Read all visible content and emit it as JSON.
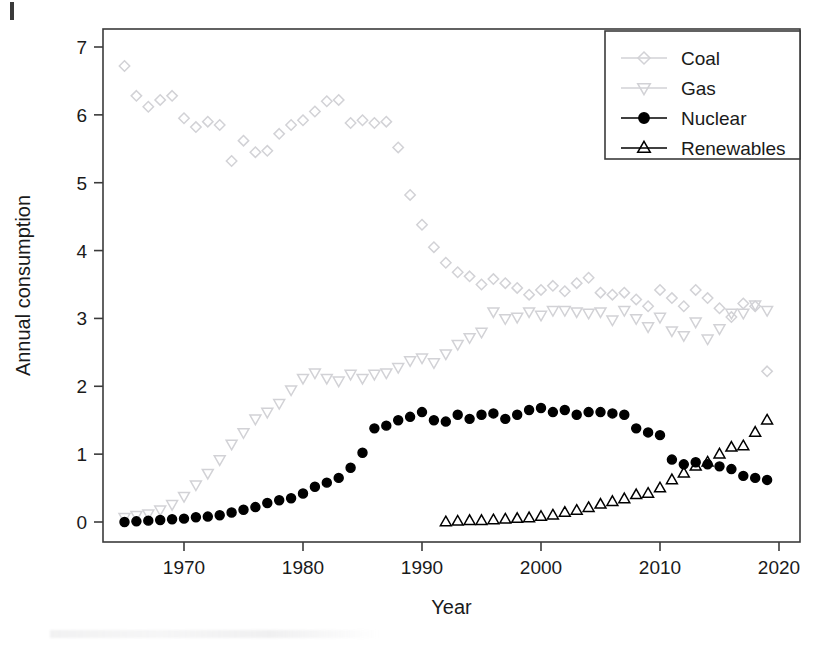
{
  "chart_data": {
    "type": "scatter",
    "title": "",
    "xlabel": "Year",
    "ylabel": "Annual consumption",
    "xlim": [
      1964.0,
      2020.6
    ],
    "ylim": [
      -0.28,
      7.35
    ],
    "xticks": [
      1970,
      1980,
      1990,
      2000,
      2010,
      2020
    ],
    "yticks": [
      0,
      1,
      2,
      3,
      4,
      5,
      6,
      7
    ],
    "grid": false,
    "legend_position": "top-right",
    "box": true,
    "series": [
      {
        "name": "Coal",
        "marker": "diamond",
        "filled": false,
        "color": "#d2d2d6",
        "x": [
          1965,
          1966,
          1967,
          1968,
          1969,
          1970,
          1971,
          1972,
          1973,
          1974,
          1975,
          1976,
          1977,
          1978,
          1979,
          1980,
          1981,
          1982,
          1983,
          1984,
          1985,
          1986,
          1987,
          1988,
          1989,
          1990,
          1991,
          1992,
          1993,
          1994,
          1995,
          1996,
          1997,
          1998,
          1999,
          2000,
          2001,
          2002,
          2003,
          2004,
          2005,
          2006,
          2007,
          2008,
          2009,
          2010,
          2011,
          2012,
          2013,
          2014,
          2015,
          2016,
          2017,
          2018,
          2019
        ],
        "y": [
          6.72,
          6.28,
          6.12,
          6.22,
          6.28,
          5.95,
          5.82,
          5.9,
          5.85,
          5.32,
          5.62,
          5.45,
          5.47,
          5.72,
          5.85,
          5.92,
          6.05,
          6.2,
          6.22,
          5.88,
          5.92,
          5.88,
          5.9,
          5.52,
          4.82,
          4.38,
          4.05,
          3.82,
          3.68,
          3.62,
          3.5,
          3.58,
          3.52,
          3.45,
          3.35,
          3.42,
          3.48,
          3.4,
          3.52,
          3.6,
          3.38,
          3.35,
          3.38,
          3.28,
          3.18,
          3.42,
          3.3,
          3.18,
          3.42,
          3.3,
          3.15,
          3.02,
          3.22,
          3.18,
          2.22
        ]
      },
      {
        "name": "Gas",
        "marker": "triangle-down",
        "filled": false,
        "color": "#d2d2d6",
        "x": [
          1965,
          1966,
          1967,
          1968,
          1969,
          1970,
          1971,
          1972,
          1973,
          1974,
          1975,
          1976,
          1977,
          1978,
          1979,
          1980,
          1981,
          1982,
          1983,
          1984,
          1985,
          1986,
          1987,
          1988,
          1989,
          1990,
          1991,
          1992,
          1993,
          1994,
          1995,
          1996,
          1997,
          1998,
          1999,
          2000,
          2001,
          2002,
          2003,
          2004,
          2005,
          2006,
          2007,
          2008,
          2009,
          2010,
          2011,
          2012,
          2013,
          2014,
          2015,
          2016,
          2017,
          2018,
          2019
        ],
        "y": [
          0.07,
          0.1,
          0.12,
          0.18,
          0.26,
          0.38,
          0.55,
          0.72,
          0.92,
          1.15,
          1.32,
          1.52,
          1.62,
          1.75,
          1.95,
          2.12,
          2.2,
          2.12,
          2.08,
          2.18,
          2.12,
          2.18,
          2.2,
          2.28,
          2.38,
          2.42,
          2.35,
          2.48,
          2.62,
          2.72,
          2.8,
          3.1,
          3.0,
          3.02,
          3.1,
          3.05,
          3.12,
          3.12,
          3.1,
          3.08,
          3.1,
          2.98,
          3.12,
          3.0,
          2.88,
          3.02,
          2.82,
          2.75,
          2.95,
          2.7,
          2.85,
          3.08,
          3.08,
          3.2,
          3.12
        ]
      },
      {
        "name": "Nuclear",
        "marker": "circle",
        "filled": true,
        "color": "#000000",
        "x": [
          1965,
          1966,
          1967,
          1968,
          1969,
          1970,
          1971,
          1972,
          1973,
          1974,
          1975,
          1976,
          1977,
          1978,
          1979,
          1980,
          1981,
          1982,
          1983,
          1984,
          1985,
          1986,
          1987,
          1988,
          1989,
          1990,
          1991,
          1992,
          1993,
          1994,
          1995,
          1996,
          1997,
          1998,
          1999,
          2000,
          2001,
          2002,
          2003,
          2004,
          2005,
          2006,
          2007,
          2008,
          2009,
          2010,
          2011,
          2012,
          2013,
          2014,
          2015,
          2016,
          2017,
          2018,
          2019
        ],
        "y": [
          0.0,
          0.01,
          0.02,
          0.03,
          0.04,
          0.05,
          0.07,
          0.08,
          0.1,
          0.14,
          0.18,
          0.22,
          0.28,
          0.32,
          0.35,
          0.42,
          0.52,
          0.58,
          0.65,
          0.8,
          1.02,
          1.38,
          1.42,
          1.5,
          1.55,
          1.62,
          1.5,
          1.48,
          1.58,
          1.52,
          1.58,
          1.6,
          1.52,
          1.58,
          1.65,
          1.68,
          1.62,
          1.65,
          1.58,
          1.62,
          1.62,
          1.6,
          1.58,
          1.38,
          1.32,
          1.28,
          0.92,
          0.85,
          0.88,
          0.85,
          0.82,
          0.78,
          0.68,
          0.65,
          0.62
        ]
      },
      {
        "name": "Renewables",
        "marker": "triangle-up",
        "filled": false,
        "color": "#000000",
        "x": [
          1992,
          1993,
          1994,
          1995,
          1996,
          1997,
          1998,
          1999,
          2000,
          2001,
          2002,
          2003,
          2004,
          2005,
          2006,
          2007,
          2008,
          2009,
          2010,
          2011,
          2012,
          2013,
          2014,
          2015,
          2016,
          2017,
          2018,
          2019
        ],
        "y": [
          0.0,
          0.01,
          0.02,
          0.02,
          0.03,
          0.04,
          0.05,
          0.06,
          0.08,
          0.1,
          0.14,
          0.17,
          0.21,
          0.26,
          0.3,
          0.34,
          0.4,
          0.42,
          0.5,
          0.62,
          0.72,
          0.82,
          0.88,
          1.0,
          1.1,
          1.12,
          1.32,
          1.5
        ]
      }
    ]
  },
  "legend": {
    "items": [
      {
        "label": "Coal"
      },
      {
        "label": "Gas"
      },
      {
        "label": "Nuclear"
      },
      {
        "label": "Renewables"
      }
    ]
  }
}
